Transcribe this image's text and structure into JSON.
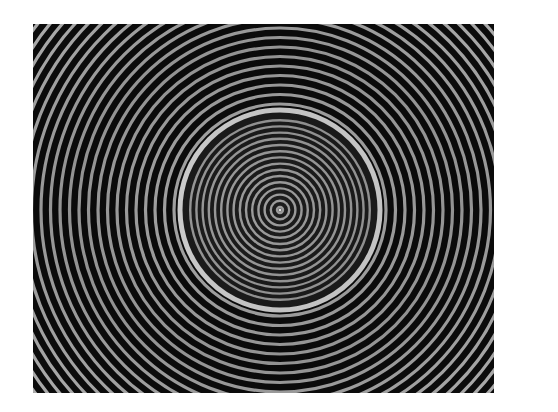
{
  "image": {
    "subject": "Concentric circular interference fringe pattern",
    "description": "Dark background with bright concentric rings; an inner circular region with finer, denser rings bounded by a bright rim",
    "frame": {
      "x": 33,
      "y": 24,
      "width": 461,
      "height": 369
    },
    "center": {
      "x": 247,
      "y": 186
    },
    "outer_rings": {
      "period_px": 9.5,
      "min_radius": 106,
      "max_radius": 420,
      "color": "#c8c8c8",
      "stroke_px": 3.2
    },
    "inner_disk": {
      "radius": 100,
      "period_px": 6.2,
      "color": "#bdbdbd",
      "stroke_px": 2.4,
      "rim_color": "#d8d8d8",
      "rim_width": 5
    },
    "background_color": "#0c0c0c",
    "page_background": "#ffffff"
  }
}
